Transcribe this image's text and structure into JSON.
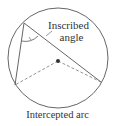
{
  "diagram": {
    "labels": {
      "inscribed_line1": "Inscribed",
      "inscribed_line2": "angle",
      "intercepted_arc": "Intercepted arc"
    },
    "colors": {
      "stroke": "#555555",
      "dashed": "#777777",
      "center_dot": "#333333",
      "text": "#333333"
    },
    "geometry": {
      "circle": {
        "cx": 58,
        "cy": 58,
        "r": 50
      },
      "vertex": {
        "x": 24,
        "y": 23
      },
      "left_point": {
        "x": 15,
        "y": 85
      },
      "right_point": {
        "x": 101,
        "y": 82
      },
      "center": {
        "x": 58,
        "y": 61
      }
    }
  }
}
